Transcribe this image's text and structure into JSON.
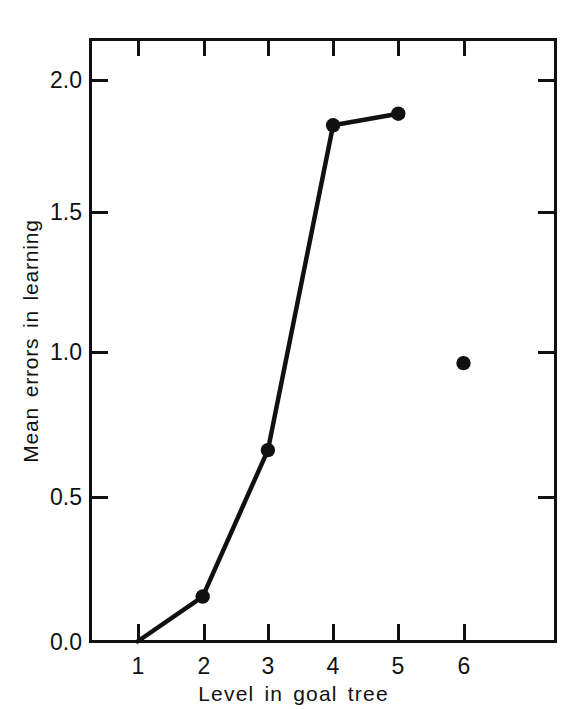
{
  "chart_data": {
    "type": "line",
    "title": "",
    "xlabel": "Level in goal tree",
    "ylabel": "Mean errors in learning",
    "x": [
      1,
      2,
      3,
      4,
      5,
      6
    ],
    "xtick_labels": [
      "1",
      "2",
      "3",
      "4",
      "5",
      "6"
    ],
    "ytick_labels": [
      "0.0",
      "0.5",
      "1.0",
      "1.5",
      "2.0"
    ],
    "ytick_values": [
      0.0,
      0.5,
      1.0,
      1.5,
      2.0
    ],
    "xlim": [
      0.25,
      7.4
    ],
    "ylim": [
      0.0,
      2.17
    ],
    "grid": false,
    "legend": null,
    "series": [
      {
        "name": "Mean errors in learning",
        "connected_x": [
          1,
          2,
          3,
          4,
          5
        ],
        "connected_values": [
          0.0,
          0.155,
          0.66,
          1.78,
          1.82
        ],
        "markers_x": [
          2,
          3,
          4,
          5,
          6
        ],
        "markers_values": [
          0.155,
          0.66,
          1.78,
          1.82,
          0.96
        ],
        "marker": "filled-circle",
        "color": "#111111"
      }
    ]
  },
  "axes": {
    "y_title": "Mean errors in learning",
    "x_title": "Level in goal tree"
  },
  "colors": {
    "ink": "#111111",
    "background": "#ffffff"
  }
}
